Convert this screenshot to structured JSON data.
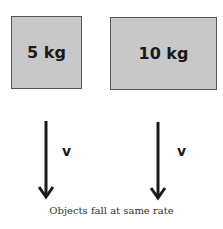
{
  "objects": [
    {
      "label": "5 kg",
      "mass_kg": 5
    },
    {
      "label": "10 kg",
      "mass_kg": 10
    }
  ],
  "arrows": [
    {
      "label": "v",
      "direction": "down"
    },
    {
      "label": "v",
      "direction": "down"
    }
  ],
  "caption": "Objects fall at same rate",
  "colors": {
    "box_fill": "#c8c8c8",
    "box_border": "#555555",
    "text": "#1a1a1a"
  }
}
